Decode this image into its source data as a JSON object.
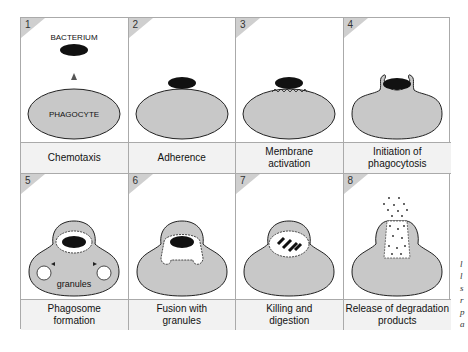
{
  "colors": {
    "cell_fill": "#c8c8c8",
    "bacterium": "#111111",
    "caption_bg": "#f2f2f2",
    "grid_line": "#aaaaaa"
  },
  "labels": {
    "bacterium": "BACTERIUM",
    "phagocyte": "PHAGOCYTE",
    "granules": "granules"
  },
  "steps": [
    {
      "num": "1",
      "caption": "Chemotaxis"
    },
    {
      "num": "2",
      "caption": "Adherence"
    },
    {
      "num": "3",
      "caption": "Membrane\nactivation"
    },
    {
      "num": "4",
      "caption": "Initiation of\nphagocytosis"
    },
    {
      "num": "5",
      "caption": "Phagosome\nformation"
    },
    {
      "num": "6",
      "caption": "Fusion with\ngranules"
    },
    {
      "num": "7",
      "caption": "Killing and\ndigestion"
    },
    {
      "num": "8",
      "caption": "Release of degradation\nproducts"
    }
  ],
  "side_text_fragments": [
    "l",
    "l",
    "s",
    "r",
    "p",
    "a"
  ]
}
